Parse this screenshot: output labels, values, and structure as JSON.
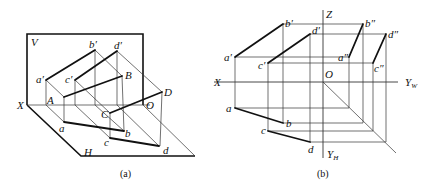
{
  "figure_a": {
    "caption": "(a)",
    "labels": {
      "V": "V",
      "H": "H",
      "X": "X",
      "O": "O",
      "A": "A",
      "B": "B",
      "C": "C",
      "D": "D",
      "a_prime": "a′",
      "b_prime": "b′",
      "c_prime": "c′",
      "d_prime": "d′",
      "a": "a",
      "b": "b",
      "c": "c",
      "d": "d"
    }
  },
  "figure_b": {
    "caption": "(b)",
    "labels": {
      "Z": "Z",
      "X": "X",
      "O": "O",
      "Y_W": "Y",
      "Y_W_sub": "W",
      "Y_H": "Y",
      "Y_H_sub": "H",
      "a_prime": "a′",
      "b_prime": "b′",
      "c_prime": "c′",
      "d_prime": "d′",
      "a_dprime": "a″",
      "b_dprime": "b″",
      "c_dprime": "c″",
      "d_dprime": "d″",
      "a": "a",
      "b": "b",
      "c": "c",
      "d": "d"
    }
  }
}
